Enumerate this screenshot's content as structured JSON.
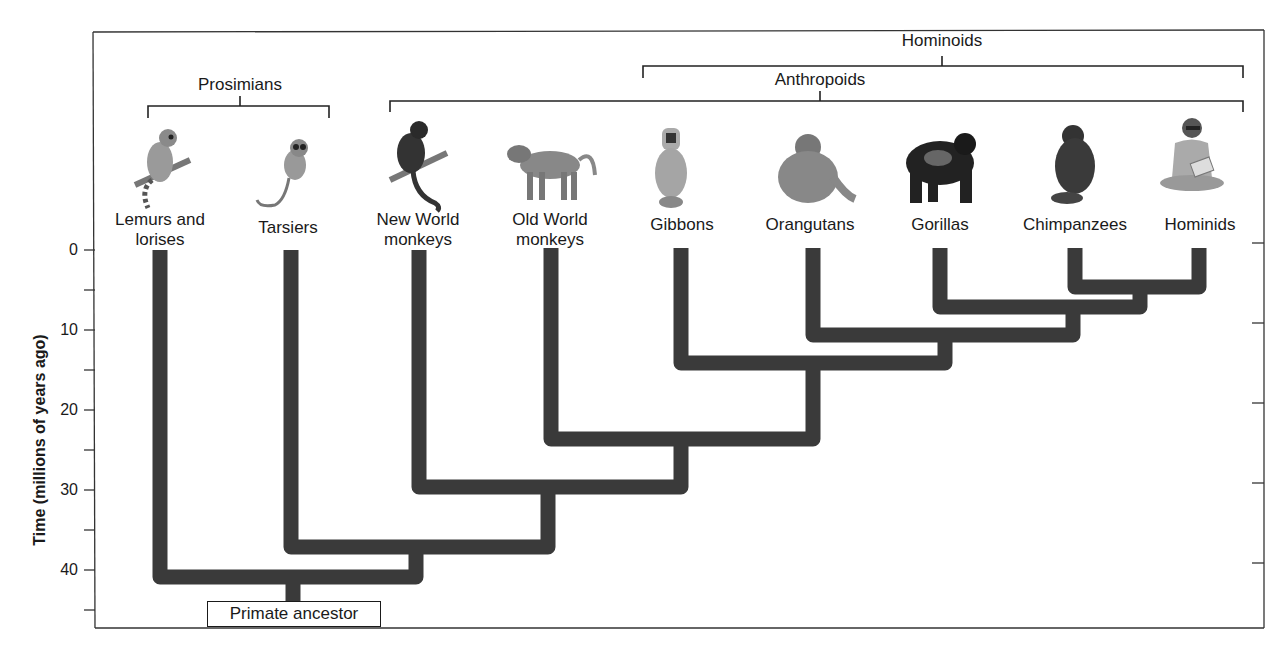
{
  "diagram": {
    "axis": {
      "title": "Time (millions of years ago)",
      "major_ticks": [
        0,
        10,
        20,
        30,
        40
      ],
      "minor_ticks": [
        5,
        15,
        25,
        35,
        45
      ],
      "direction": "increasing downward"
    },
    "groups": {
      "prosimians": "Prosimians",
      "anthropoids": "Anthropoids",
      "hominoids": "Hominoids"
    },
    "taxa": [
      {
        "id": "lemurs",
        "label_line1": "Lemurs and",
        "label_line2": "lorises",
        "icon": "lemur-illustration"
      },
      {
        "id": "tarsiers",
        "label_line1": "Tarsiers",
        "label_line2": "",
        "icon": "tarsier-illustration"
      },
      {
        "id": "nwm",
        "label_line1": "New World",
        "label_line2": "monkeys",
        "icon": "new-world-monkey-illustration"
      },
      {
        "id": "owm",
        "label_line1": "Old World",
        "label_line2": "monkeys",
        "icon": "baboon-illustration"
      },
      {
        "id": "gibbons",
        "label_line1": "Gibbons",
        "label_line2": "",
        "icon": "gibbon-illustration"
      },
      {
        "id": "orangutans",
        "label_line1": "Orangutans",
        "label_line2": "",
        "icon": "orangutan-illustration"
      },
      {
        "id": "gorillas",
        "label_line1": "Gorillas",
        "label_line2": "",
        "icon": "gorilla-illustration"
      },
      {
        "id": "chimps",
        "label_line1": "Chimpanzees",
        "label_line2": "",
        "icon": "chimpanzee-illustration"
      },
      {
        "id": "hominids",
        "label_line1": "Hominids",
        "label_line2": "",
        "icon": "human-illustration"
      }
    ],
    "divergences_mya": [
      {
        "split": "Chimpanzees / Hominids",
        "time": 5.5
      },
      {
        "split": "Gorillas / (Chimpanzees + Hominids)",
        "time": 7.5
      },
      {
        "split": "Orangutans / African apes",
        "time": 11
      },
      {
        "split": "Gibbons / Great apes",
        "time": 14.5
      },
      {
        "split": "Old World monkeys / Hominoids",
        "time": 24
      },
      {
        "split": "New World monkeys / Old World anthropoids",
        "time": 30
      },
      {
        "split": "Tarsiers / Anthropoids",
        "time": 37.5
      },
      {
        "split": "Lemurs and lorises / rest",
        "time": 41.5
      }
    ],
    "root": {
      "label": "Primate ancestor",
      "time": 44
    }
  }
}
